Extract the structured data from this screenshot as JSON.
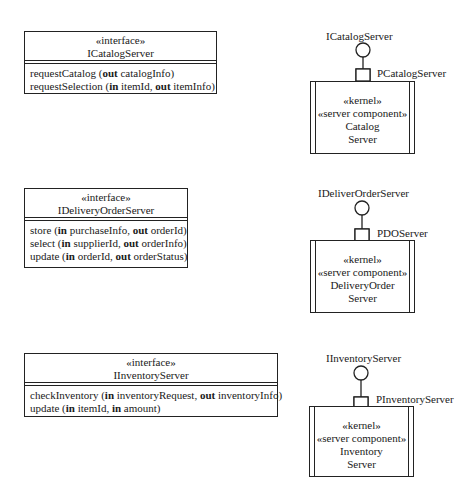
{
  "interfaces": [
    {
      "stereotype": "«interface»",
      "name": "ICatalogServer",
      "operations": [
        {
          "name": "requestCatalog (",
          "params": [
            {
              "dir": "out",
              "name": "catalogInfo"
            }
          ]
        },
        {
          "name": "requestSelection (",
          "params": [
            {
              "dir": "in",
              "name": "itemId"
            },
            {
              "dir": "out",
              "name": "itemInfo"
            }
          ]
        }
      ]
    },
    {
      "stereotype": "«interface»",
      "name": "IDeliveryOrderServer",
      "operations": [
        {
          "name": "store (",
          "params": [
            {
              "dir": "in",
              "name": "purchaseInfo"
            },
            {
              "dir": "out",
              "name": "orderId"
            }
          ]
        },
        {
          "name": "select (",
          "params": [
            {
              "dir": "in",
              "name": "supplierId"
            },
            {
              "dir": "out",
              "name": "orderInfo"
            }
          ]
        },
        {
          "name": "update (",
          "params": [
            {
              "dir": "in",
              "name": "orderId"
            },
            {
              "dir": "out",
              "name": "orderStatus"
            }
          ]
        }
      ]
    },
    {
      "stereotype": "«interface»",
      "name": "IInventoryServer",
      "operations": [
        {
          "name": "checkInventory (",
          "params": [
            {
              "dir": "in",
              "name": "inventoryRequest"
            },
            {
              "dir": "out",
              "name": "inventoryInfo"
            }
          ]
        },
        {
          "name": "update (",
          "params": [
            {
              "dir": "in",
              "name": "itemId"
            },
            {
              "dir": "in",
              "name": "amount"
            }
          ]
        }
      ]
    }
  ],
  "components": [
    {
      "provided_interface": "ICatalogServer",
      "port": "PCatalogServer",
      "stereotype1": "«kernel»",
      "stereotype2": "«server component»",
      "name_line1": "Catalog",
      "name_line2": "Server"
    },
    {
      "provided_interface": "IDeliverOrderServer",
      "port": "PDOServer",
      "stereotype1": "«kernel»",
      "stereotype2": "«server component»",
      "name_line1": "DeliveryOrder",
      "name_line2": "Server"
    },
    {
      "provided_interface": "IInventoryServer",
      "port": "PInventoryServer",
      "stereotype1": "«kernel»",
      "stereotype2": "«server component»",
      "name_line1": "Inventory",
      "name_line2": "Server"
    }
  ]
}
